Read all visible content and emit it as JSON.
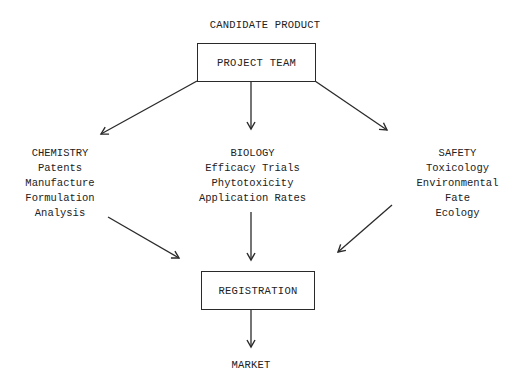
{
  "diagram": {
    "top_label": "CANDIDATE PRODUCT",
    "project_team": "PROJECT TEAM",
    "chemistry": {
      "title": "CHEMISTRY",
      "items": [
        "Patents",
        "Manufacture",
        "Formulation",
        "Analysis"
      ]
    },
    "biology": {
      "title": "BIOLOGY",
      "items": [
        "Efficacy Trials",
        "Phytotoxicity",
        "Application Rates"
      ]
    },
    "safety": {
      "title": "SAFETY",
      "items": [
        "Toxicology",
        "Environmental",
        "Fate",
        "Ecology"
      ]
    },
    "registration": "REGISTRATION",
    "bottom_label": "MARKET",
    "edges": [
      {
        "from": "PROJECT TEAM",
        "to": "CHEMISTRY"
      },
      {
        "from": "PROJECT TEAM",
        "to": "BIOLOGY"
      },
      {
        "from": "PROJECT TEAM",
        "to": "SAFETY"
      },
      {
        "from": "CHEMISTRY",
        "to": "REGISTRATION"
      },
      {
        "from": "BIOLOGY",
        "to": "REGISTRATION"
      },
      {
        "from": "SAFETY",
        "to": "REGISTRATION"
      },
      {
        "from": "REGISTRATION",
        "to": "MARKET"
      }
    ],
    "line_color": "#2a2a2a"
  }
}
